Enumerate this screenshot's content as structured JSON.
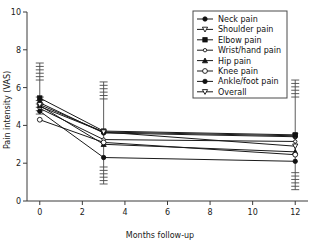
{
  "chart_data": {
    "type": "line",
    "title": "",
    "subtitle": "",
    "xlabel": "Months follow-up",
    "ylabel": "Pain intensity (VAS)",
    "x": [
      0,
      3,
      12
    ],
    "xlim": [
      -0.6,
      12.6
    ],
    "ylim": [
      0,
      10
    ],
    "xticks": [
      0,
      2,
      4,
      6,
      8,
      10,
      12
    ],
    "xtick_labels": [
      "0",
      "2",
      "4",
      "6",
      "8",
      "10",
      "12"
    ],
    "yticks": [
      0,
      2,
      4,
      6,
      8,
      10
    ],
    "ytick_labels": [
      "0",
      "2",
      "4",
      "6",
      "8",
      "10"
    ],
    "grid": false,
    "legend_position": "top-right",
    "error_bars": "SD whiskers shown at each time point",
    "series": [
      {
        "name": "Neck pain",
        "marker": "filled-circle",
        "values": [
          5.2,
          3.6,
          3.4
        ],
        "err_low": [
          4.6,
          0.9,
          0.6
        ],
        "err_high": [
          7.3,
          6.3,
          6.4
        ]
      },
      {
        "name": "Shoulder pain",
        "marker": "open-down-triangle",
        "values": [
          5.0,
          3.65,
          3.45
        ],
        "err_low": [
          4.6,
          0.9,
          0.6
        ],
        "err_high": [
          7.3,
          6.3,
          6.4
        ]
      },
      {
        "name": "Elbow pain",
        "marker": "filled-square",
        "values": [
          5.45,
          3.7,
          3.5
        ],
        "err_low": [
          4.6,
          0.9,
          0.6
        ],
        "err_high": [
          7.3,
          6.3,
          6.4
        ]
      },
      {
        "name": "Wrist/hand pain",
        "marker": "open-circle-small",
        "values": [
          4.9,
          3.25,
          3.15
        ],
        "err_low": [
          4.6,
          0.9,
          0.6
        ],
        "err_high": [
          7.3,
          6.3,
          6.4
        ]
      },
      {
        "name": "Hip pain",
        "marker": "filled-up-triangle",
        "values": [
          5.05,
          3.0,
          2.6
        ],
        "err_low": [
          4.6,
          0.9,
          0.6
        ],
        "err_high": [
          7.3,
          6.3,
          6.4
        ]
      },
      {
        "name": "Knee pain",
        "marker": "open-circle",
        "values": [
          4.3,
          3.1,
          2.45
        ],
        "err_low": [
          4.6,
          0.9,
          0.6
        ],
        "err_high": [
          7.3,
          6.3,
          6.4
        ]
      },
      {
        "name": "Ankle/foot pain",
        "marker": "filled-circle",
        "values": [
          4.75,
          2.3,
          2.1
        ],
        "err_low": [
          4.6,
          0.9,
          0.6
        ],
        "err_high": [
          7.3,
          6.3,
          6.4
        ]
      },
      {
        "name": "Overall",
        "marker": "open-down-triangle",
        "values": [
          5.1,
          3.65,
          2.9
        ],
        "err_low": [
          4.6,
          0.9,
          0.6
        ],
        "err_high": [
          7.3,
          6.3,
          6.4
        ]
      }
    ]
  },
  "legend": {
    "items": [
      {
        "label": "Neck pain"
      },
      {
        "label": "Shoulder pain"
      },
      {
        "label": "Elbow pain"
      },
      {
        "label": "Wrist/hand pain"
      },
      {
        "label": "Hip pain"
      },
      {
        "label": "Knee pain"
      },
      {
        "label": "Ankle/foot pain"
      },
      {
        "label": "Overall"
      }
    ]
  },
  "colors": {
    "line": "#1a1a1a",
    "axis": "#3a3a3a",
    "error": "#4a4a4a",
    "background": "#ffffff"
  }
}
